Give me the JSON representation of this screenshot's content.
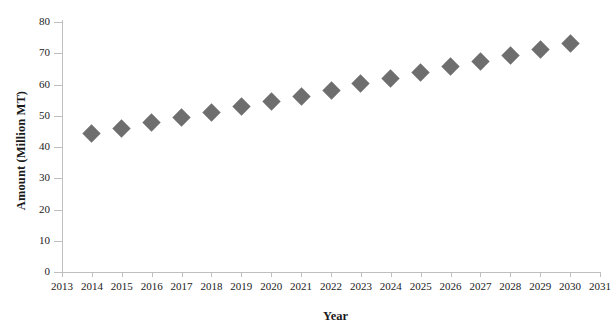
{
  "chart_data": {
    "type": "scatter",
    "title": "",
    "xlabel": "Year",
    "ylabel": "Amount (Million MT)",
    "x": [
      2014,
      2015,
      2016,
      2017,
      2018,
      2019,
      2020,
      2021,
      2022,
      2023,
      2024,
      2025,
      2026,
      2027,
      2028,
      2029,
      2030
    ],
    "values": [
      44.3,
      46.0,
      47.8,
      49.4,
      51.2,
      53.0,
      54.6,
      56.3,
      58.2,
      60.2,
      62.0,
      63.8,
      65.8,
      67.5,
      69.4,
      71.3,
      73.0
    ],
    "series": [
      {
        "name": "Amount",
        "values": [
          44.3,
          46.0,
          47.8,
          49.4,
          51.2,
          53.0,
          54.6,
          56.3,
          58.2,
          60.2,
          62.0,
          63.8,
          65.8,
          67.5,
          69.4,
          71.3,
          73.0
        ]
      }
    ],
    "xlim": [
      2013,
      2031
    ],
    "ylim": [
      0,
      80
    ],
    "x_ticks": [
      "2013",
      "2014",
      "2015",
      "2016",
      "2017",
      "2018",
      "2019",
      "2020",
      "2021",
      "2022",
      "2023",
      "2024",
      "2025",
      "2026",
      "2027",
      "2028",
      "2029",
      "2030",
      "2031"
    ],
    "y_ticks": [
      "0",
      "10",
      "20",
      "30",
      "40",
      "50",
      "60",
      "70",
      "80"
    ],
    "grid": false,
    "legend": "none",
    "marker_shape": "diamond",
    "marker_color": "#6e6e6e",
    "axis_color": "#bfbfbf"
  },
  "axes": {
    "y_title": "Amount (Million MT)",
    "x_title": "Year"
  }
}
